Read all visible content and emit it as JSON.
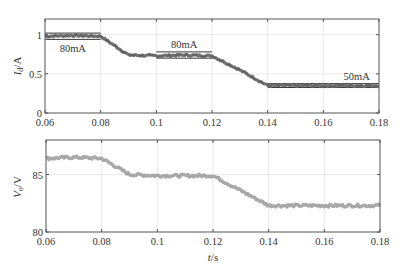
{
  "chart_data": [
    {
      "type": "line",
      "ylabel": "I_d/A",
      "ylabel_main": "I",
      "ylabel_sub": "d",
      "ylabel_unit": "/A",
      "xlabel": "",
      "xlim": [
        0.06,
        0.18
      ],
      "ylim": [
        0,
        1.2
      ],
      "xticks": [
        0.06,
        0.08,
        0.1,
        0.12,
        0.14,
        0.16,
        0.18
      ],
      "xtick_labels": [
        "0.06",
        "0.08",
        "0.1",
        "0.12",
        "0.14",
        "0.16",
        "0.18"
      ],
      "yticks": [
        0,
        0.5,
        1
      ],
      "ytick_labels": [
        "0",
        "0.5",
        "1"
      ],
      "grid": true,
      "series": [
        {
          "name": "Id",
          "color": "#707070",
          "x": [
            0.06,
            0.07,
            0.08,
            0.09,
            0.1,
            0.11,
            0.12,
            0.13,
            0.14,
            0.15,
            0.16,
            0.17,
            0.18
          ],
          "values": [
            0.98,
            0.99,
            0.98,
            0.74,
            0.73,
            0.74,
            0.73,
            0.55,
            0.35,
            0.35,
            0.35,
            0.35,
            0.35
          ]
        }
      ],
      "bands": [
        {
          "x": [
            0.06,
            0.08
          ],
          "y": [
            0.94,
            1.02
          ],
          "label": "80mA"
        },
        {
          "x": [
            0.1,
            0.12
          ],
          "y": [
            0.7,
            0.78
          ],
          "label": "80mA"
        },
        {
          "x": [
            0.14,
            0.18
          ],
          "y": [
            0.325,
            0.375
          ],
          "label": "50mA"
        }
      ],
      "annotations": [
        "80mA",
        "80mA",
        "50mA"
      ]
    },
    {
      "type": "line",
      "ylabel": "V_o/V",
      "ylabel_main": "V",
      "ylabel_sub": "o",
      "ylabel_unit": "/V",
      "xlabel": "t/s",
      "xlabel_main": "t",
      "xlabel_unit": "/s",
      "xlim": [
        0.06,
        0.18
      ],
      "ylim": [
        80,
        88
      ],
      "xticks": [
        0.06,
        0.08,
        0.1,
        0.12,
        0.14,
        0.16,
        0.18
      ],
      "xtick_labels": [
        "0.06",
        "0.08",
        "0.1",
        "0.12",
        "0.14",
        "0.16",
        "0.18"
      ],
      "yticks": [
        80,
        85
      ],
      "ytick_labels": [
        "80",
        "85"
      ],
      "grid": true,
      "series": [
        {
          "name": "Vo",
          "color": "#a8a8a8",
          "x": [
            0.06,
            0.07,
            0.08,
            0.09,
            0.1,
            0.11,
            0.12,
            0.13,
            0.14,
            0.15,
            0.16,
            0.17,
            0.18
          ],
          "values": [
            86.4,
            86.5,
            86.4,
            85.0,
            84.9,
            84.9,
            84.9,
            83.6,
            82.3,
            82.3,
            82.3,
            82.3,
            82.3
          ]
        }
      ]
    }
  ]
}
